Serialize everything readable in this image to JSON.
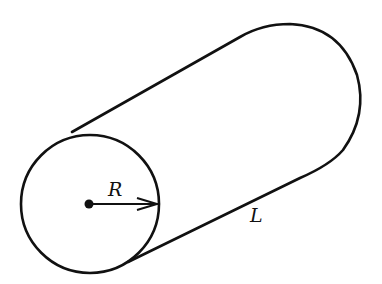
{
  "figure": {
    "shape": "cylinder",
    "labels": {
      "radius": "R",
      "length": "L"
    },
    "stroke_color": "#111111",
    "background": "#ffffff"
  }
}
